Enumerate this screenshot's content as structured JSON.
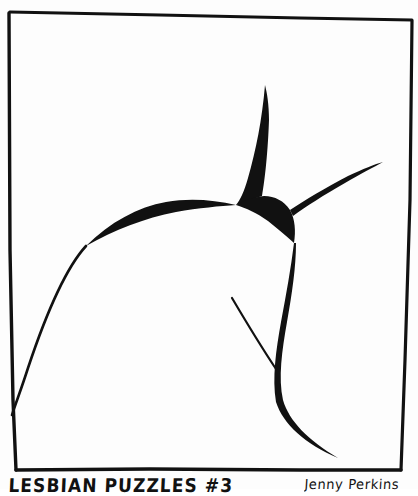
{
  "artwork": {
    "kind": "hand-drawn cartoon panel",
    "medium": "black ink line drawing on white paper",
    "background_color": "#fdfdfd",
    "ink_color": "#111111",
    "frame": {
      "name": "hand-drawn rectangular border",
      "top_left": [
        9,
        11
      ],
      "top_right": [
        412,
        20
      ],
      "bottom_right": [
        400,
        470
      ],
      "bottom_left": [
        16,
        470
      ],
      "stroke_width": 3
    },
    "figure": {
      "description": "Abstract three-pointed black junction with tapering arms and thin sweeping curves",
      "elements": [
        {
          "name": "upper-arm",
          "note": "fine point at top thickening down into the junction",
          "tip": [
            265,
            85
          ]
        },
        {
          "name": "right-arm",
          "note": "tapers to a fine point toward the right border",
          "tip": [
            383,
            162
          ]
        },
        {
          "name": "lower-arm",
          "note": "thick curving stroke descending and tapering to the lower right",
          "tip": [
            338,
            458
          ]
        },
        {
          "name": "left-sweep-curve",
          "note": "thin curve sweeping from the junction down to the left border",
          "tip": [
            12,
            415
          ]
        },
        {
          "name": "interior-thin-line",
          "note": "short thin line meeting the thick lower stroke at a point",
          "start": [
            232,
            298
          ],
          "end": [
            276,
            369
          ]
        }
      ]
    }
  },
  "caption": {
    "title": "LESBIAN PUZZLES #3",
    "signature": "Jenny Perkins",
    "clipped_by_bottom_edge": true
  }
}
